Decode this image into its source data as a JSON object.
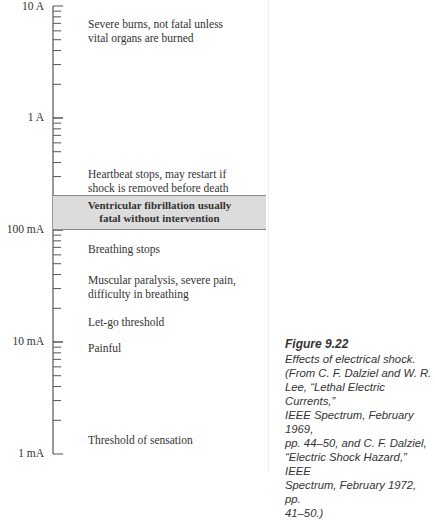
{
  "figure": {
    "number": "Figure 9.22",
    "caption": "Effects of electrical shock.\n(From C. F. Dalziel and W. R.\nLee, “Lethal Electric Currents,”\nIEEE Spectrum, February 1969,\npp. 44–50, and C. F. Dalziel,\n“Electric Shock Hazard,” IEEE\nSpectrum, February 1972, pp.\n41–50.)"
  },
  "axis": {
    "scale": "log",
    "labels": [
      {
        "text": "10 A",
        "value_amps": 10
      },
      {
        "text": "1 A",
        "value_amps": 1
      },
      {
        "text": "100 mA",
        "value_amps": 0.1
      },
      {
        "text": "10 mA",
        "value_amps": 0.01
      },
      {
        "text": "1 mA",
        "value_amps": 0.001
      }
    ]
  },
  "effects": [
    {
      "text": "Severe burns, not fatal unless\nvital organs are burned",
      "approx_current": "~6 A"
    },
    {
      "text": "Heartbeat stops, may restart if\nshock is removed before death",
      "approx_current": "~250 mA"
    },
    {
      "text": "Breathing stops",
      "approx_current": "~70 mA"
    },
    {
      "text": "Muscular paralysis, severe pain,\ndifficulty in breathing",
      "approx_current": "~30 mA"
    },
    {
      "text": "Let-go threshold",
      "approx_current": "~15 mA"
    },
    {
      "text": "Painful",
      "approx_current": "~9 mA"
    },
    {
      "text": "Threshold of sensation",
      "approx_current": "~1 mA"
    }
  ],
  "band": {
    "text": "Ventricular fibrillation usually\nfatal without intervention",
    "range": "100 mA – 200 mA",
    "fill_color": "#dcdcdc",
    "border_color": "#8a8a8a"
  }
}
